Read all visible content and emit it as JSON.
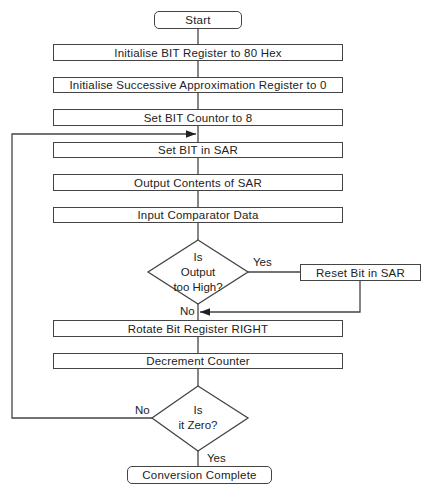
{
  "flowchart": {
    "start": "Start",
    "steps": [
      "Initialise BIT Register to 80 Hex",
      "Initialise Successive Approximation Register to 0",
      "Set BIT Countor to 8",
      "Set BIT in SAR",
      "Output Contents of SAR",
      "Input Comparator Data"
    ],
    "decision1": {
      "line1": "Is",
      "line2": "Output",
      "line3": "too High?",
      "yes": "Yes",
      "no": "No"
    },
    "reset_step": "Reset Bit in SAR",
    "steps2": [
      "Rotate Bit Register RIGHT",
      "Decrement Counter"
    ],
    "decision2": {
      "line1": "Is",
      "line2": "it Zero?",
      "yes": "Yes",
      "no": "No"
    },
    "end": "Conversion Complete"
  }
}
